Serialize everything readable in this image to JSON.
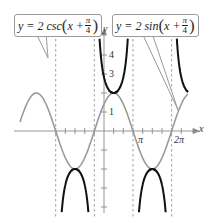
{
  "chart_data": {
    "type": "line",
    "title": "",
    "xlabel": "x",
    "ylabel": "y",
    "xlim": [
      -4.2,
      8.4
    ],
    "ylim": [
      -4.8,
      4.8
    ],
    "grid": false,
    "x_tick_labels": [
      "π",
      "2π"
    ],
    "y_tick_labels": [
      "1",
      "3",
      "4"
    ],
    "x_tick_step": "π/4",
    "asymptotes_x": [
      "-5π/4",
      "-π/4",
      "3π/4",
      "7π/4"
    ],
    "series": [
      {
        "name": "y = 2 csc(x + π/4)",
        "function": "2/sin(x+pi/4)",
        "color": "#111111",
        "style": "solid-thick"
      },
      {
        "name": "y = 2 sin(x + π/4)",
        "function": "2*sin(x+pi/4)",
        "color": "#9a9a9a",
        "style": "solid"
      }
    ],
    "annotations": [
      {
        "text": "y = 2 csc(x + π/4)",
        "type": "callout",
        "points_to": "csc curve"
      },
      {
        "text": "y = 2 sin(x + π/4)",
        "type": "callout",
        "points_to": "sin curve"
      }
    ]
  },
  "labels": {
    "csc_prefix": "y = 2 csc",
    "sin_prefix": "y = 2 sin",
    "x_var": "x +",
    "pi": "π",
    "four": "4",
    "open_paren": "(",
    "close_paren": ")",
    "x_axis": "x",
    "y_axis": "y",
    "tick_pi": "π",
    "tick_2pi": "2π",
    "y1": "1",
    "y3": "3",
    "y4": "4"
  }
}
